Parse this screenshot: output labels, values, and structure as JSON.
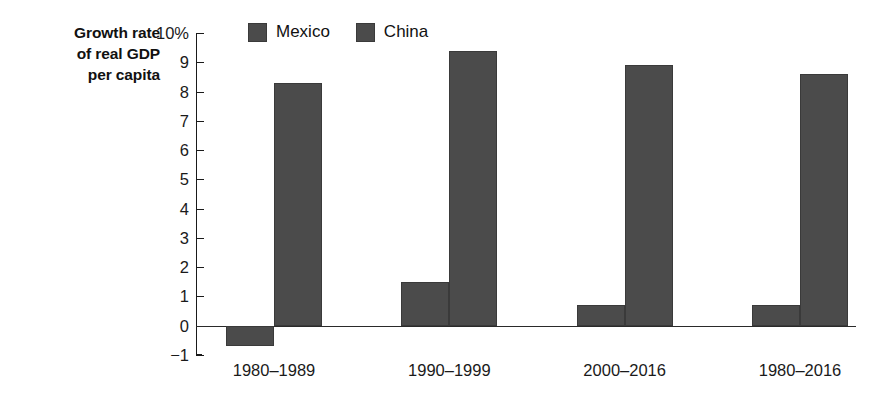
{
  "chart_data": {
    "type": "bar",
    "title": "",
    "ylabel": "Growth rate of real GDP per capita",
    "ylabel_lines": [
      "Growth rate",
      "of real GDP",
      "per capita"
    ],
    "xlabel": "",
    "categories": [
      "1980–1989",
      "1990–1999",
      "2000–2016",
      "1980–2016"
    ],
    "series": [
      {
        "name": "Mexico",
        "color": "#4b4b4b",
        "values": [
          -0.7,
          1.5,
          0.7,
          0.7
        ]
      },
      {
        "name": "China",
        "color": "#4b4b4b",
        "values": [
          8.3,
          9.4,
          8.9,
          8.6
        ]
      }
    ],
    "ylim": [
      -1,
      10
    ],
    "ytick_values": [
      10,
      9,
      8,
      7,
      6,
      5,
      4,
      3,
      2,
      1,
      0,
      -1
    ],
    "ytick_labels": [
      "10%",
      "9",
      "8",
      "7",
      "6",
      "5",
      "4",
      "3",
      "2",
      "1",
      "0",
      "−1"
    ],
    "grid": false,
    "legend_position": "top-center",
    "units": "percent"
  },
  "legend": {
    "items": [
      {
        "label": "Mexico",
        "swatch": "legend-swatch-mexico"
      },
      {
        "label": "China",
        "swatch": "legend-swatch-china"
      }
    ]
  },
  "axis": {
    "title_line_1": "Growth rate",
    "title_line_2": "of real GDP",
    "title_line_3": "per capita"
  },
  "colors": {
    "bar": "#4b4b4b",
    "axis": "#1a1a1a",
    "background": "#ffffff"
  }
}
